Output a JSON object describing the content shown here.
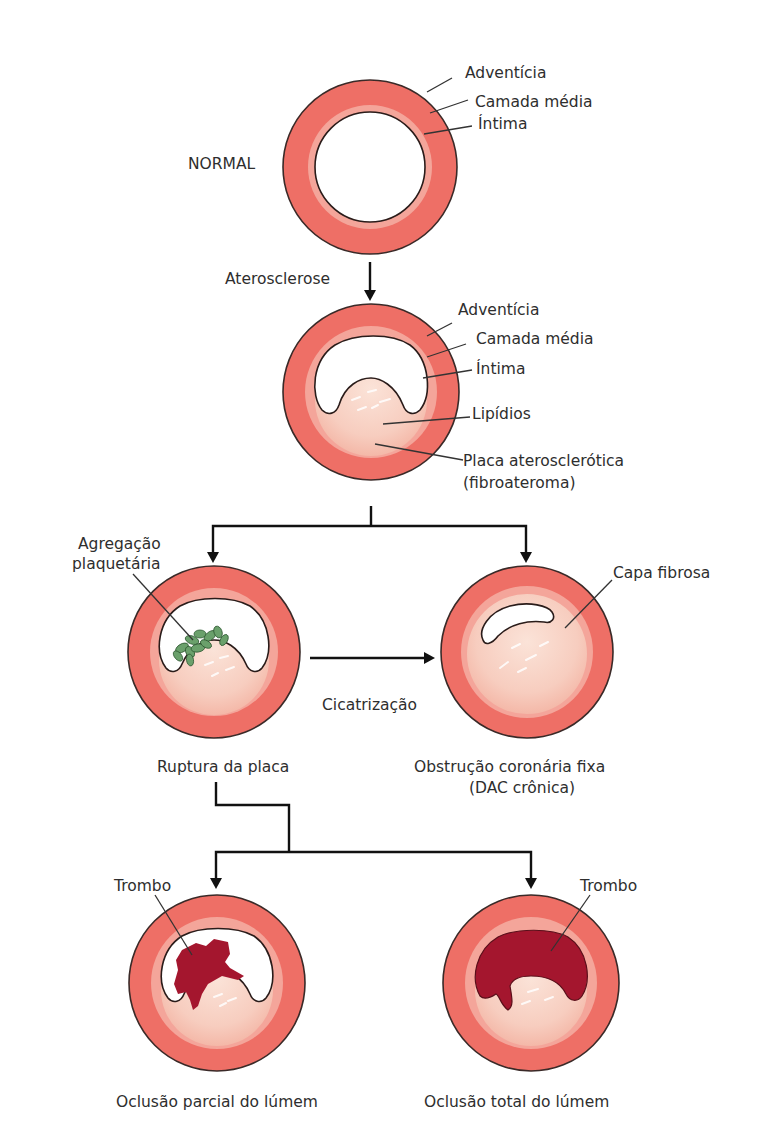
{
  "colors": {
    "adventitia": "#ee6f66",
    "media": "#f29b90",
    "intima": "#f6b0a6",
    "plaque": "#f7cfc0",
    "plaque_highlight": "#fbe6dc",
    "thrombus": "#a4162e",
    "platelets": "#6aa06b",
    "outline": "#3a2a28",
    "arrow": "#111111"
  },
  "stages": {
    "normal": {
      "title": "NORMAL",
      "labels": [
        "Adventícia",
        "Camada média",
        "Íntima"
      ]
    },
    "transition_1": {
      "label": "Aterosclerose"
    },
    "atherosclerosis": {
      "labels": [
        "Adventícia",
        "Camada média",
        "Íntima",
        "Lipídios",
        "Placa aterosclerótica",
        "(fibroateroma)"
      ]
    },
    "rupture": {
      "annotation_line1": "Agregação",
      "annotation_line2": "plaquetária",
      "caption": "Ruptura da placa"
    },
    "transition_2": {
      "label": "Cicatrização"
    },
    "fixed_obstruction": {
      "annotation": "Capa fibrosa",
      "caption_line1": "Obstrução coronária fixa",
      "caption_line2": "(DAC crônica)"
    },
    "partial_occlusion": {
      "annotation": "Trombo",
      "caption": "Oclusão parcial do lúmem"
    },
    "total_occlusion": {
      "annotation": "Trombo",
      "caption": "Oclusão total do lúmem"
    }
  }
}
